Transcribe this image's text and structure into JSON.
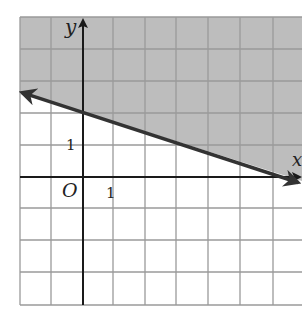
{
  "graph": {
    "type": "linear-inequality",
    "boundary_line": "y = -1/3 x + 2",
    "boundary_style": "solid",
    "shaded_region": "above line",
    "grid": {
      "x_min": -2,
      "x_max": 7,
      "y_min": -4,
      "y_max": 5,
      "step": 1
    },
    "colors": {
      "shade": "#bdbdbd",
      "grid": "#9a9a9a",
      "axis": "#1a1a1a",
      "line": "#333333"
    }
  },
  "labels": {
    "y_axis": "y",
    "x_axis": "x",
    "origin": "O",
    "x_tick": "1",
    "y_tick": "1"
  }
}
